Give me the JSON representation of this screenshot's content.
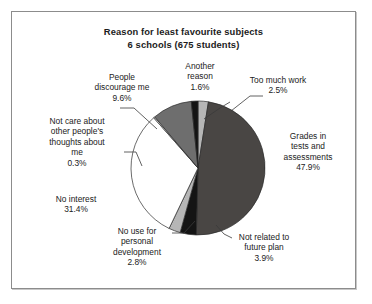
{
  "chart_data": {
    "type": "pie",
    "title": "Reason for least favourite subjects\n6 schools (675 students)",
    "title_lines": [
      "Reason for least favourite subjects",
      "6 schools (675 students)"
    ],
    "total_respondents": 675,
    "schools": 6,
    "xlabel": "",
    "ylabel": "",
    "grid": false,
    "legend_position": "none",
    "labels_outside": true,
    "categories": [
      "Too much work",
      "Grades in tests and assessments",
      "Not related to future plan",
      "No use for personal development",
      "No interest",
      "Not care about other people's thoughts about me",
      "People discourage me",
      "Another reason"
    ],
    "values": [
      2.5,
      47.9,
      3.9,
      2.8,
      31.4,
      0.3,
      9.6,
      1.6
    ],
    "value_unit": "%",
    "slice_colors": [
      "#b6b6b6",
      "#494644",
      "#141414",
      "#b6b6b6",
      "#ffffff",
      "#ffffff",
      "#6e6e6e",
      "#141414"
    ],
    "slices": [
      {
        "label_lines": [
          "Too much work"
        ],
        "value_label": "2.5%",
        "value": 2.5,
        "color": "#b6b6b6",
        "leader": true
      },
      {
        "label_lines": [
          "Grades in",
          "tests and",
          "assessments"
        ],
        "value_label": "47.9%",
        "value": 47.9,
        "color": "#494644",
        "leader": false
      },
      {
        "label_lines": [
          "Not related to",
          "future plan"
        ],
        "value_label": "3.9%",
        "value": 3.9,
        "color": "#141414",
        "leader": true
      },
      {
        "label_lines": [
          "No use for",
          "personal",
          "development"
        ],
        "value_label": "2.8%",
        "value": 2.8,
        "color": "#b6b6b6",
        "leader": true
      },
      {
        "label_lines": [
          "No interest"
        ],
        "value_label": "31.4%",
        "value": 31.4,
        "color": "#ffffff",
        "leader": false
      },
      {
        "label_lines": [
          "Not care about",
          "other people's",
          "thoughts about",
          "me"
        ],
        "value_label": "0.3%",
        "value": 0.3,
        "color": "#ffffff",
        "leader": true
      },
      {
        "label_lines": [
          "People",
          "discourage me"
        ],
        "value_label": "9.6%",
        "value": 9.6,
        "color": "#6e6e6e",
        "leader": true
      },
      {
        "label_lines": [
          "Another",
          "reason"
        ],
        "value_label": "1.6%",
        "value": 1.6,
        "color": "#141414",
        "leader": true
      }
    ]
  },
  "frame": {
    "border_color": "#8c8c8c",
    "background": "#ffffff"
  }
}
